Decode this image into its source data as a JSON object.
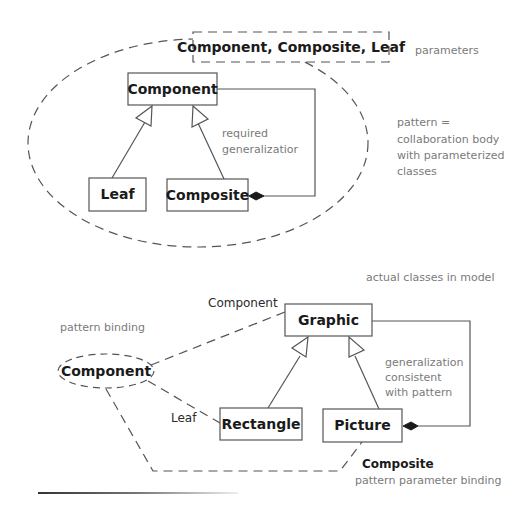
{
  "colors": {
    "background": "#ffffff",
    "stroke": "#555555",
    "class_text": "#1a1a1a",
    "note_text": "#7a7a7a"
  },
  "pattern": {
    "parameters_box": "Component, Composite, Leaf",
    "parameters_note": "parameters",
    "description_note": [
      "pattern =",
      "collaboration body",
      "with parameterized",
      "classes"
    ],
    "classes": {
      "component": "Component",
      "leaf": "Leaf",
      "composite": "Composite"
    },
    "generalization_note": [
      "required",
      "generalizatior"
    ]
  },
  "model": {
    "title_note": "actual classes in model",
    "binding_note": "pattern binding",
    "collaboration_use": "Component",
    "classes": {
      "graphic": "Graphic",
      "rectangle": "Rectangle",
      "picture": "Picture"
    },
    "role_labels": {
      "component": "Component",
      "leaf": "Leaf",
      "composite": "Composite"
    },
    "generalization_note": [
      "generalization",
      "consistent",
      "with pattern"
    ],
    "parameter_binding_note": "pattern parameter binding"
  }
}
